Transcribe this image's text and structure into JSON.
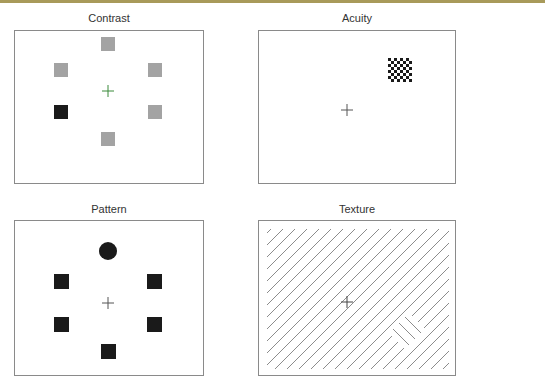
{
  "figure": {
    "panels": [
      {
        "id": "contrast",
        "title": "Contrast",
        "description": "Six squares arranged around a green fixation cross; one target square is black, distractors are gray"
      },
      {
        "id": "acuity",
        "title": "Acuity",
        "description": "Fixation cross with a small checkerboard patch in the upper right"
      },
      {
        "id": "pattern",
        "title": "Pattern",
        "description": "Six shapes around a fixation cross; one target is a black circle, distractors are black squares"
      },
      {
        "id": "texture",
        "title": "Texture",
        "description": "Field of diagonal lines with a fixation cross; a small patch of opposite-orientation lines in the lower right"
      }
    ]
  },
  "colors": {
    "border": "#8a8a8a",
    "gray_square": "#a3a3a3",
    "black": "#1a1a1a",
    "green_cross": "#3a8a3a",
    "cross": "#555555",
    "lines": "#8c8c8c",
    "topbar": "#a89a5a"
  }
}
